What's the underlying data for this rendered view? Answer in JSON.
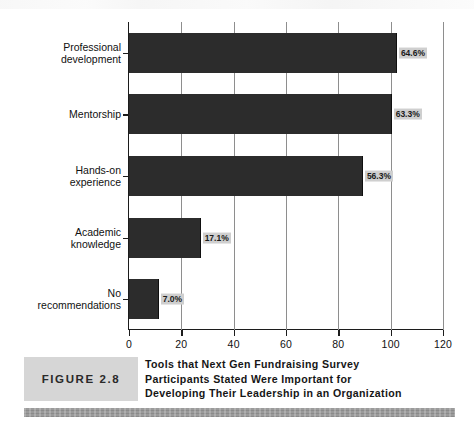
{
  "chart_data": {
    "type": "bar",
    "orientation": "horizontal",
    "title": "",
    "xlabel": "",
    "ylabel": "",
    "xlim": [
      0,
      120
    ],
    "xticks": [
      0,
      20,
      40,
      60,
      80,
      100,
      120
    ],
    "grid": true,
    "legend": "none",
    "categories": [
      "Professional\ndevelopment",
      "Mentorship",
      "Hands-on\nexperience",
      "Academic\nknowledge",
      "No recommendations"
    ],
    "values": [
      102,
      100,
      89,
      27,
      11
    ],
    "data_labels": [
      "64.6%",
      "63.3%",
      "56.3%",
      "17.1%",
      "7.0%"
    ],
    "bar_color": "#2c2c2c",
    "label_box_color": "#cfcfcf"
  },
  "caption": {
    "figure_tag": "FIGURE 2.8",
    "title_lines": [
      "Tools that Next Gen Fundraising Survey",
      "Participants Stated Were Important for",
      "Developing Their Leadership in an Organization"
    ]
  },
  "colors": {
    "bar": "#2c2c2c",
    "label_box": "#cfcfcf",
    "tag_box": "#d6d6d6",
    "footer_bar": "#9b9b9b",
    "axis": "#1c1c1c",
    "gridline": "#8e8e8e",
    "background": "#ffffff"
  }
}
